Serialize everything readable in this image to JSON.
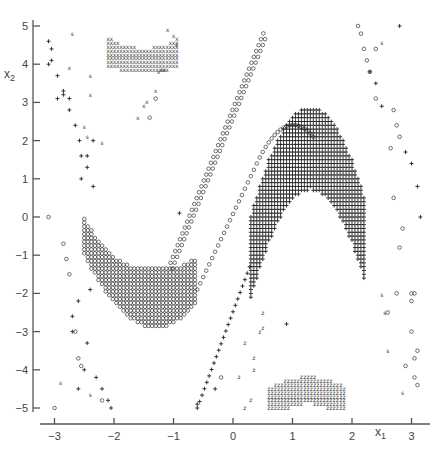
{
  "chart_data": {
    "type": "scatter",
    "title": "",
    "xlabel": "x1",
    "ylabel": "x2",
    "xlim": [
      -3.2,
      3.2
    ],
    "ylim": [
      -5.1,
      5.1
    ],
    "xticks": [
      -3,
      -2,
      -1,
      0,
      1,
      2,
      3
    ],
    "yticks": [
      5,
      4,
      3,
      2,
      1,
      0,
      -1,
      -2,
      -3,
      -4,
      -5
    ],
    "grid": false,
    "legend": null,
    "marker_symbols": [
      "+",
      "o",
      "x",
      "z",
      "s"
    ],
    "regions": [
      {
        "name": "upper-x-cluster",
        "marker": "x",
        "description": "dense U-shaped band of x markers near top",
        "x_range": [
          -2.1,
          -0.9
        ],
        "y_range": [
          3.9,
          5.0
        ],
        "center": [
          -1.5,
          5.6
        ],
        "r_inner": 1.1,
        "r_outer": 1.7
      },
      {
        "name": "lower-z-cluster",
        "marker": "z",
        "description": "dense arch of z markers near bottom",
        "x_range": [
          0.6,
          1.9
        ],
        "y_range": [
          -5.0,
          -3.9
        ],
        "center": [
          1.25,
          -5.6
        ],
        "r_inner": 1.0,
        "r_outer": 1.7
      },
      {
        "name": "left-o-valley",
        "marker": "o",
        "description": "dense valley of o markers",
        "x_range": [
          -2.5,
          -0.7
        ],
        "y_range": [
          -2.9,
          1.3
        ]
      },
      {
        "name": "right-plus-hill",
        "marker": "+",
        "description": "dense hill of + markers",
        "x_range": [
          0.3,
          2.2
        ],
        "y_range": [
          -5.0,
          2.9
        ]
      },
      {
        "name": "diagonal-o-line",
        "marker": "o",
        "description": "ascending line of o markers",
        "x_range": [
          -1.0,
          0.5
        ],
        "y_range": [
          -1.0,
          5.0
        ]
      }
    ],
    "sparse_points": {
      "plus": [
        [
          -3.1,
          4.6
        ],
        [
          -3.05,
          4.4
        ],
        [
          -3.05,
          4.1
        ],
        [
          -3.1,
          4.0
        ],
        [
          -2.95,
          3.7
        ],
        [
          -2.85,
          3.3
        ],
        [
          -2.85,
          3.2
        ],
        [
          -2.75,
          3.1
        ],
        [
          -2.95,
          3.1
        ],
        [
          -2.75,
          2.8
        ],
        [
          -2.65,
          2.4
        ],
        [
          -2.58,
          2.0
        ],
        [
          -2.35,
          2.0
        ],
        [
          -2.45,
          1.6
        ],
        [
          -2.55,
          1.6
        ],
        [
          -2.45,
          1.3
        ],
        [
          -2.55,
          1.0
        ],
        [
          -2.35,
          0.8
        ],
        [
          -2.4,
          -1.9
        ],
        [
          -2.6,
          -2.2
        ],
        [
          -2.7,
          -2.6
        ],
        [
          -2.7,
          -3.0
        ],
        [
          -2.45,
          -3.3
        ],
        [
          -2.5,
          -4.0
        ],
        [
          -2.3,
          -4.2
        ],
        [
          -2.6,
          -4.5
        ],
        [
          -2.2,
          -4.5
        ],
        [
          -2.1,
          -4.8
        ],
        [
          -2.05,
          -5.0
        ],
        [
          -0.9,
          0.1
        ],
        [
          2.8,
          5.0
        ],
        [
          2.3,
          3.8
        ],
        [
          2.4,
          3.5
        ],
        [
          2.5,
          2.9
        ],
        [
          2.9,
          1.7
        ],
        [
          3.0,
          1.4
        ],
        [
          3.1,
          0.8
        ],
        [
          3.15,
          0.0
        ],
        [
          0.9,
          -2.8
        ],
        [
          -0.6,
          -4.9
        ],
        [
          -0.3,
          -4.5
        ]
      ],
      "circle": [
        [
          -3.1,
          0.0
        ],
        [
          -2.85,
          -0.7
        ],
        [
          -2.8,
          -1.1
        ],
        [
          -2.75,
          -1.5
        ],
        [
          -2.65,
          -3.0
        ],
        [
          -2.6,
          -3.7
        ],
        [
          -2.55,
          -3.9
        ],
        [
          -2.2,
          -4.8
        ],
        [
          -3.0,
          -5.0
        ],
        [
          -1.3,
          3.1
        ],
        [
          -1.4,
          2.6
        ],
        [
          -0.2,
          -4.2
        ],
        [
          2.1,
          5.0
        ],
        [
          2.15,
          4.8
        ],
        [
          2.2,
          4.4
        ],
        [
          2.4,
          4.4
        ],
        [
          2.25,
          4.1
        ],
        [
          2.3,
          3.8
        ],
        [
          2.4,
          3.1
        ],
        [
          2.7,
          2.8
        ],
        [
          2.75,
          2.4
        ],
        [
          2.8,
          2.1
        ],
        [
          2.65,
          1.8
        ],
        [
          2.7,
          0.5
        ],
        [
          2.85,
          -0.3
        ],
        [
          2.8,
          -0.8
        ],
        [
          2.75,
          -2.0
        ],
        [
          3.0,
          -2.0
        ],
        [
          3.0,
          -2.2
        ],
        [
          3.05,
          -2.0
        ],
        [
          3.0,
          -3.0
        ],
        [
          3.1,
          -3.5
        ],
        [
          3.05,
          -3.7
        ],
        [
          3.05,
          -4.2
        ],
        [
          3.1,
          -4.4
        ],
        [
          2.9,
          -3.9
        ],
        [
          2.6,
          -2.5
        ]
      ],
      "x_sparse": [
        [
          -2.75,
          3.9
        ],
        [
          -1.1,
          4.9
        ],
        [
          -1.0,
          4.75
        ],
        [
          -0.95,
          4.5
        ],
        [
          -1.25,
          3.8
        ],
        [
          -1.3,
          3.3
        ],
        [
          -1.45,
          3.0
        ],
        [
          -1.5,
          2.9
        ],
        [
          -1.6,
          2.6
        ],
        [
          -1.2,
          3.85
        ],
        [
          -1.15,
          3.85
        ]
      ],
      "s_sparse": [
        [
          -2.7,
          4.8
        ],
        [
          -2.4,
          3.7
        ],
        [
          -2.4,
          3.2
        ],
        [
          -2.5,
          2.35
        ],
        [
          -2.45,
          2.1
        ],
        [
          -2.2,
          1.95
        ],
        [
          -2.4,
          -4.65
        ],
        [
          -2.9,
          -4.35
        ],
        [
          2.5,
          4.55
        ],
        [
          2.55,
          -2.5
        ],
        [
          2.6,
          -3.5
        ],
        [
          2.85,
          -4.6
        ],
        [
          2.5,
          -2.05
        ]
      ],
      "z_sparse": [
        [
          0.35,
          -3.7
        ],
        [
          0.45,
          -3.0
        ],
        [
          0.5,
          -2.9
        ],
        [
          0.5,
          -2.5
        ],
        [
          0.2,
          -3.3
        ],
        [
          0.2,
          -5.0
        ],
        [
          0.3,
          -4.8
        ],
        [
          0.35,
          -4.0
        ],
        [
          0.1,
          -4.2
        ]
      ]
    }
  },
  "axes": {
    "x_label": "x",
    "x_sub": "1",
    "y_label": "x",
    "y_sub": "2"
  }
}
